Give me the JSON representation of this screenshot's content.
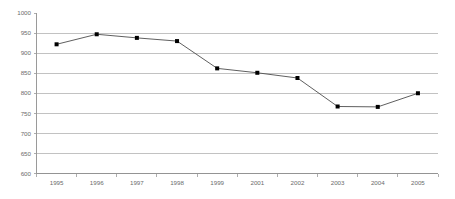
{
  "chart_data": {
    "type": "line",
    "title": "",
    "subtitle": "",
    "xlabel": "",
    "ylabel": "",
    "categories": [
      "1995",
      "1996",
      "1997",
      "1998",
      "1999",
      "2001",
      "2002",
      "2003",
      "2004",
      "2005"
    ],
    "values": [
      922,
      947,
      938,
      930,
      862,
      851,
      838,
      767,
      766,
      800
    ],
    "series": [
      {
        "name": "",
        "values": [
          922,
          947,
          938,
          930,
          862,
          851,
          838,
          767,
          766,
          800
        ]
      }
    ],
    "ylim": [
      600,
      1000
    ],
    "ytick_labels": [
      "600",
      "650",
      "700",
      "750",
      "800",
      "850",
      "900",
      "950",
      "1000"
    ],
    "ytick_values": [
      600,
      650,
      700,
      750,
      800,
      850,
      900,
      950,
      1000
    ],
    "xtick_labels": [
      "1995",
      "1996",
      "1997",
      "1998",
      "1999",
      "2001",
      "2002",
      "2003",
      "2004",
      "2005"
    ],
    "grid": "horizontal",
    "legend": "none",
    "marker": "square",
    "line_color": "#4d4d4d",
    "marker_color": "#000000",
    "grid_color": "#b3b3b3",
    "axis_color": "#8f8f8f",
    "label_color": "#6b6b6b",
    "background_color": "#ffffff"
  }
}
